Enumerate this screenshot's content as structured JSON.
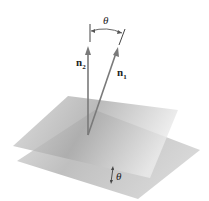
{
  "figure": {
    "normals": [
      {
        "id": "n1",
        "label_base": "n",
        "label_sub": "1"
      },
      {
        "id": "n2",
        "label_base": "n",
        "label_sub": "2"
      }
    ],
    "angle_top_label": "θ",
    "angle_bottom_label": "θ",
    "colors": {
      "plane_upper": "#b8b8b8",
      "plane_lower": "#c8c8c8",
      "vector": "#7a7a7a",
      "text": "#222222"
    }
  }
}
